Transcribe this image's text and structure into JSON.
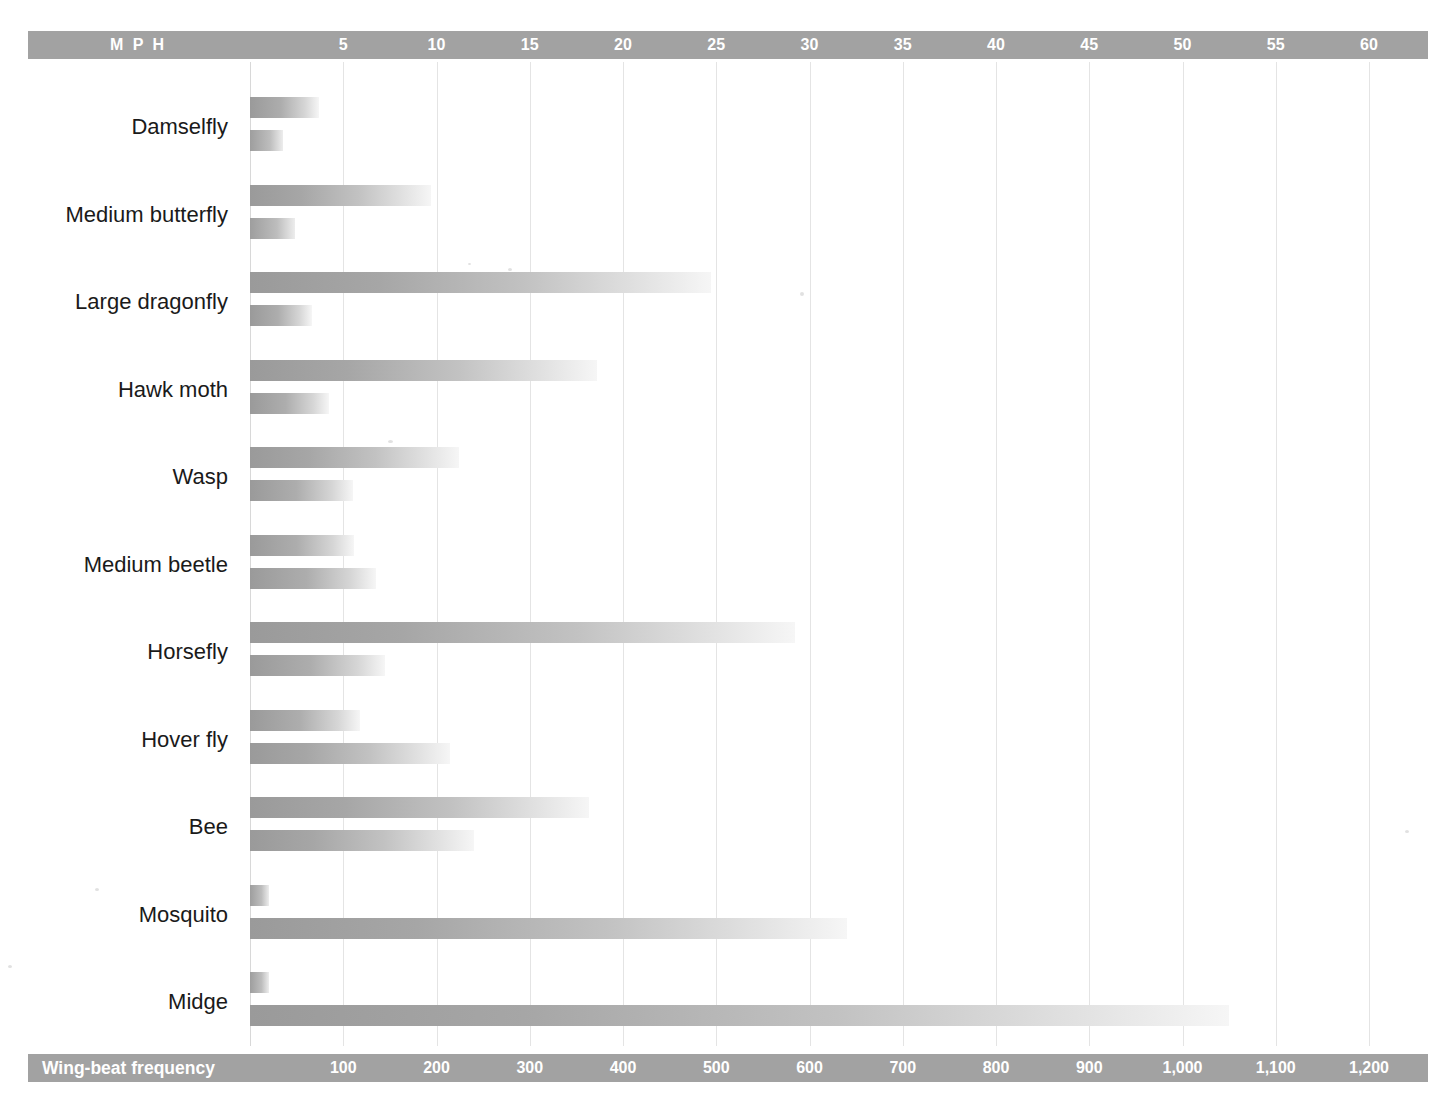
{
  "chart_data": {
    "type": "bar",
    "title": "",
    "orientation": "horizontal",
    "grid": true,
    "legend_position": "axis-headers",
    "categories": [
      "Damselfly",
      "Medium butterfly",
      "Large dragonfly",
      "Hawk moth",
      "Wasp",
      "Medium beetle",
      "Horsefly",
      "Hover fly",
      "Bee",
      "Mosquito",
      "Midge"
    ],
    "series": [
      {
        "name": "MPH",
        "axis": "top",
        "unit": "mph",
        "xlim": [
          0,
          63
        ],
        "ticks": [
          5,
          10,
          15,
          20,
          25,
          30,
          35,
          40,
          45,
          50,
          55,
          60
        ],
        "values": [
          3.7,
          9.7,
          24.7,
          18.6,
          11.2,
          5.6,
          29.2,
          5.9,
          18.2,
          1.0,
          1.0
        ]
      },
      {
        "name": "Wing-beat frequency",
        "axis": "bottom",
        "unit": "beats per second",
        "xlim": [
          0,
          1260
        ],
        "ticks": [
          100,
          200,
          300,
          400,
          500,
          600,
          700,
          800,
          900,
          1000,
          1100,
          1200
        ],
        "values": [
          35,
          48,
          66,
          85,
          110,
          135,
          145,
          215,
          240,
          640,
          1050
        ]
      }
    ],
    "xlabel_top": "M P H",
    "xlabel_bottom": "Wing-beat frequency",
    "ylabel": ""
  },
  "top_axis": {
    "title": "M P H",
    "tick_labels": [
      "5",
      "10",
      "15",
      "20",
      "25",
      "30",
      "35",
      "40",
      "45",
      "50",
      "55",
      "60"
    ]
  },
  "bottom_axis": {
    "title": "Wing-beat frequency",
    "tick_labels": [
      "100",
      "200",
      "300",
      "400",
      "500",
      "600",
      "700",
      "800",
      "900",
      "1,000",
      "1,100",
      "1,200"
    ]
  },
  "colors": {
    "axis_bar": "#a2a2a2",
    "axis_text": "#ffffff",
    "gridline": "#e4e4e4",
    "bar_dark": "#9a9a9a",
    "bar_light": "#f6f6f6",
    "label_text": "#1a1a1a",
    "background": "#ffffff"
  }
}
